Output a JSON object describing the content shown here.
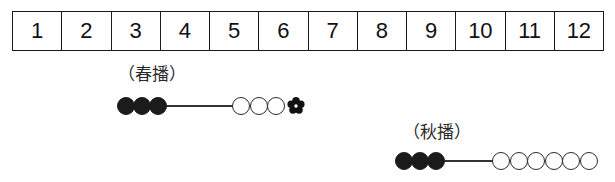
{
  "diagram": {
    "title": "",
    "months": {
      "name": "month-scale",
      "labels": [
        "1",
        "2",
        "3",
        "4",
        "5",
        "6",
        "7",
        "8",
        "9",
        "10",
        "11",
        "12"
      ]
    },
    "rows": [
      {
        "id": "spring-sowing",
        "label": "（春播）",
        "label_left": 118,
        "label_top": 66,
        "track_top": 96,
        "track_left": 117,
        "line_start": 165,
        "line_end": 234,
        "filled_count": 3,
        "open_count": 3,
        "filled_start": 117,
        "open_start": 232,
        "has_flower": true,
        "flower_left": 287,
        "flower_icon": "flower-icon"
      },
      {
        "id": "autumn-sowing",
        "label": "（秋播）",
        "label_left": 403,
        "label_top": 124,
        "track_top": 151,
        "track_left": 395,
        "line_start": 443,
        "line_end": 494,
        "filled_count": 3,
        "open_count": 6,
        "filled_start": 395,
        "open_start": 492,
        "has_flower": false,
        "flower_left": 0,
        "flower_icon": "flower-icon"
      }
    ],
    "legend": {
      "filled_marker": "filled-circle-marker",
      "open_marker": "open-circle-marker",
      "flower_marker": "flower-icon"
    }
  }
}
